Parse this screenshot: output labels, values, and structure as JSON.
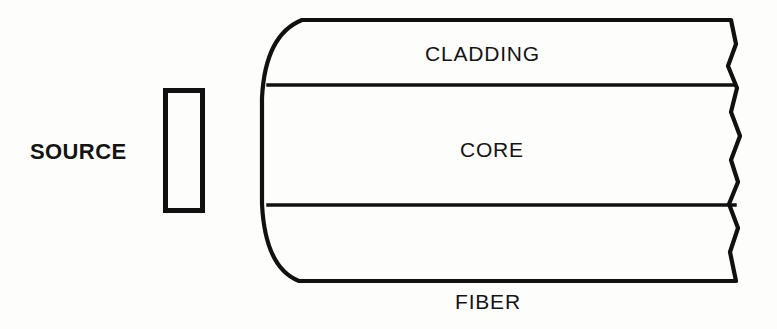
{
  "figure": {
    "background_color": "#fdfdfc",
    "line_color": "#111111",
    "width": 777,
    "height": 329
  },
  "labels": {
    "source": "SOURCE",
    "cladding": "CLADDING",
    "core": "CORE",
    "fiber": "FIBER"
  },
  "shapes": {
    "source_block": {
      "name": "source-block",
      "x": 163,
      "y": 88,
      "width": 40,
      "height": 124
    },
    "fiber_body": {
      "name": "fiber-body",
      "top_line_y": 20,
      "bottom_line_y": 281,
      "left_arc_x": 262,
      "left_arc_top_x": 302,
      "right_break_x": 733
    },
    "dividers": [
      {
        "name": "cladding-core-boundary",
        "y": 85,
        "x1": 268,
        "x2": 731
      },
      {
        "name": "core-cladding-boundary",
        "y": 205,
        "x1": 268,
        "x2": 735
      }
    ],
    "break_line": {
      "name": "fiber-break-line",
      "description": "zigzag break indicating fiber continues"
    }
  }
}
